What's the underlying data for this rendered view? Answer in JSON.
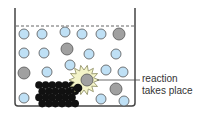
{
  "label": {
    "line1": "reaction",
    "line2": "takes place"
  },
  "colors": {
    "particle_blue": "#bfe0f5",
    "particle_gray": "#a0a0a0",
    "solid_black": "#111111",
    "burst_fill": "#f3f3c8",
    "outline": "#555555"
  },
  "blue_particles": [
    [
      24,
      34
    ],
    [
      42,
      34
    ],
    [
      65,
      32
    ],
    [
      82,
      34
    ],
    [
      101,
      34
    ],
    [
      24,
      53
    ],
    [
      44,
      53
    ],
    [
      89,
      54
    ],
    [
      116,
      54
    ],
    [
      47,
      72
    ],
    [
      70,
      65
    ],
    [
      106,
      70
    ],
    [
      123,
      72
    ],
    [
      24,
      98
    ],
    [
      101,
      99
    ],
    [
      124,
      101
    ]
  ],
  "gray_particles": [
    [
      119,
      34
    ],
    [
      67,
      49
    ],
    [
      24,
      73
    ],
    [
      116,
      89
    ]
  ],
  "reacting_particle": [
    87,
    80
  ]
}
